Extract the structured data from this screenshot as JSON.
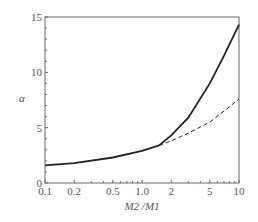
{
  "chart_data": {
    "type": "line",
    "title": "",
    "xlabel": "M2 /M1",
    "ylabel": "α",
    "xscale": "log",
    "xlim": [
      0.1,
      10
    ],
    "ylim": [
      0,
      15
    ],
    "x_ticks": [
      "0.1",
      "0.2",
      "0.5",
      "1.0",
      "2",
      "5",
      "10"
    ],
    "y_ticks": [
      "0",
      "5",
      "10",
      "15"
    ],
    "series": [
      {
        "name": "solid",
        "style": "solid",
        "x": [
          0.1,
          0.2,
          0.5,
          1.0,
          1.5,
          2,
          3,
          5,
          7,
          10
        ],
        "values": [
          1.6,
          1.8,
          2.3,
          2.9,
          3.4,
          4.3,
          5.9,
          9.0,
          11.5,
          14.3
        ]
      },
      {
        "name": "dashed",
        "style": "dashed",
        "x": [
          1.5,
          2,
          3,
          5,
          7,
          10
        ],
        "values": [
          3.4,
          3.8,
          4.5,
          5.5,
          6.5,
          7.6
        ]
      }
    ],
    "grid": false
  }
}
